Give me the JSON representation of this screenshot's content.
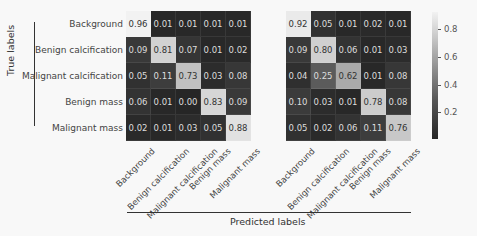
{
  "chart_data": [
    {
      "type": "heatmap",
      "title": "",
      "ylabel": "True labels",
      "xlabel": "Predicted labels",
      "categories": [
        "Background",
        "Benign calcification",
        "Malignant calcification",
        "Benign mass",
        "Malignant mass"
      ],
      "values": [
        [
          0.96,
          0.01,
          0.01,
          0.01,
          0.01
        ],
        [
          0.09,
          0.81,
          0.07,
          0.01,
          0.02
        ],
        [
          0.05,
          0.11,
          0.73,
          0.03,
          0.08
        ],
        [
          0.06,
          0.01,
          0.0,
          0.83,
          0.09
        ],
        [
          0.02,
          0.01,
          0.03,
          0.05,
          0.88
        ]
      ]
    },
    {
      "type": "heatmap",
      "title": "",
      "ylabel": "True labels",
      "xlabel": "Predicted labels",
      "categories": [
        "Background",
        "Benign calcification",
        "Malignant calcification",
        "Benign mass",
        "Malignant mass"
      ],
      "values": [
        [
          0.92,
          0.05,
          0.01,
          0.02,
          0.01
        ],
        [
          0.09,
          0.8,
          0.06,
          0.01,
          0.03
        ],
        [
          0.04,
          0.25,
          0.62,
          0.01,
          0.08
        ],
        [
          0.1,
          0.03,
          0.01,
          0.78,
          0.08
        ],
        [
          0.05,
          0.02,
          0.06,
          0.11,
          0.76
        ]
      ]
    }
  ],
  "colorbar": {
    "ticks": [
      "0.8",
      "0.6",
      "0.4",
      "0.2"
    ],
    "colormap": "gray",
    "range": [
      0.0,
      0.96
    ]
  },
  "axes": {
    "y_title": "True labels",
    "x_title": "Predicted labels"
  },
  "colors": {
    "background": "#f8f8f8",
    "low": "#262626",
    "high": "#f2f2f2"
  }
}
